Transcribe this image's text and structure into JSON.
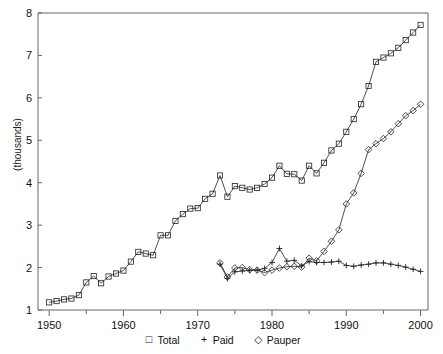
{
  "chart_data": {
    "type": "line",
    "title": "",
    "subtitle": "",
    "xlabel": "",
    "ylabel": "(thousands)",
    "xlim": [
      1948.5,
      2001.0
    ],
    "ylim": [
      1,
      8
    ],
    "grid": false,
    "legend_position": "bottom",
    "x_major_ticks": [
      1950,
      1960,
      1970,
      1980,
      1990,
      2000
    ],
    "x_minor_ticks": [
      1955,
      1965,
      1975,
      1985,
      1995
    ],
    "x_tick_labels": [
      "1950",
      "1960",
      "1970",
      "1980",
      "1990",
      "2000"
    ],
    "y_ticks": [
      1,
      2,
      3,
      4,
      5,
      6,
      7,
      8
    ],
    "y_tick_labels": [
      "1",
      "2",
      "3",
      "4",
      "5",
      "6",
      "7",
      "8"
    ],
    "series": [
      {
        "name": "Total",
        "marker": "square",
        "x": [
          1950,
          1951,
          1952,
          1953,
          1954,
          1955,
          1956,
          1957,
          1958,
          1959,
          1960,
          1961,
          1962,
          1963,
          1964,
          1965,
          1966,
          1967,
          1968,
          1969,
          1970,
          1971,
          1972,
          1973,
          1974,
          1975,
          1976,
          1977,
          1978,
          1979,
          1980,
          1981,
          1982,
          1983,
          1984,
          1985,
          1986,
          1987,
          1988,
          1989,
          1990,
          1991,
          1992,
          1993,
          1994,
          1995,
          1996,
          1997,
          1998,
          1999,
          2000
        ],
        "values": [
          1.18,
          1.21,
          1.25,
          1.27,
          1.35,
          1.65,
          1.8,
          1.63,
          1.79,
          1.86,
          1.93,
          2.14,
          2.37,
          2.33,
          2.29,
          2.76,
          2.76,
          3.1,
          3.26,
          3.39,
          3.4,
          3.62,
          3.74,
          4.17,
          3.67,
          3.92,
          3.88,
          3.84,
          3.88,
          3.97,
          4.12,
          4.4,
          4.21,
          4.2,
          4.05,
          4.4,
          4.22,
          4.47,
          4.76,
          4.92,
          5.2,
          5.5,
          5.85,
          6.28,
          6.85,
          6.95,
          7.05,
          7.18,
          7.36,
          7.54,
          7.72
        ]
      },
      {
        "name": "Paid",
        "marker": "plus",
        "x": [
          1973,
          1974,
          1975,
          1976,
          1977,
          1978,
          1979,
          1980,
          1981,
          1982,
          1983,
          1984,
          1985,
          1986,
          1987,
          1988,
          1989,
          1990,
          1991,
          1992,
          1993,
          1994,
          1995,
          1996,
          1997,
          1998,
          1999,
          2000
        ],
        "values": [
          2.08,
          1.74,
          1.9,
          1.92,
          1.93,
          1.94,
          1.98,
          2.12,
          2.45,
          2.15,
          2.17,
          2.04,
          2.14,
          2.12,
          2.12,
          2.13,
          2.15,
          2.05,
          2.03,
          2.06,
          2.08,
          2.11,
          2.11,
          2.08,
          2.05,
          2.01,
          1.96,
          1.91
        ]
      },
      {
        "name": "Pauper",
        "marker": "diamond",
        "x": [
          1973,
          1974,
          1975,
          1976,
          1977,
          1978,
          1979,
          1980,
          1981,
          1982,
          1983,
          1984,
          1985,
          1986,
          1987,
          1988,
          1989,
          1990,
          1991,
          1992,
          1993,
          1994,
          1995,
          1996,
          1997,
          1998,
          1999,
          2000
        ],
        "values": [
          2.11,
          1.78,
          1.99,
          2.0,
          1.95,
          1.94,
          1.88,
          1.94,
          1.99,
          2.02,
          2.03,
          2.01,
          2.22,
          2.16,
          2.38,
          2.62,
          2.89,
          3.5,
          3.76,
          4.22,
          4.78,
          4.92,
          5.04,
          5.2,
          5.39,
          5.58,
          5.7,
          5.85
        ]
      }
    ]
  },
  "legend": {
    "items": [
      {
        "glyph": "square-marker-icon",
        "symbol": "□",
        "label": "Total"
      },
      {
        "glyph": "plus-marker-icon",
        "symbol": "+",
        "label": "Paid"
      },
      {
        "glyph": "diamond-marker-icon",
        "symbol": "◇",
        "label": "Pauper"
      }
    ]
  },
  "colors": {
    "line": "#222222",
    "frame": "#666666",
    "text": "#111111",
    "background": "#ffffff"
  }
}
